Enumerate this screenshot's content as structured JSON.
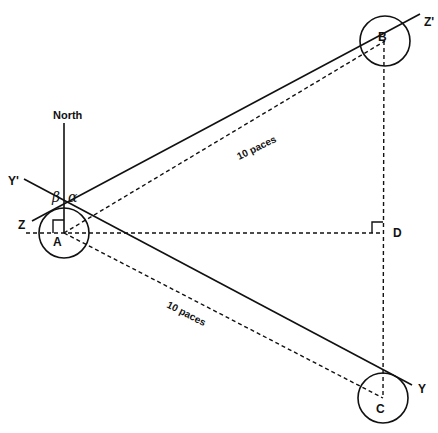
{
  "diagram": {
    "labels": {
      "north": "North",
      "z": "Z",
      "z_prime": "Z'",
      "y": "Y",
      "y_prime": "Y'",
      "a": "A",
      "b": "B",
      "c": "C",
      "d": "D",
      "alpha": "α",
      "beta": "β",
      "ab_distance": "10 paces",
      "ac_distance": "10 paces"
    },
    "colors": {
      "stroke": "#111111",
      "background": "#ffffff"
    }
  }
}
